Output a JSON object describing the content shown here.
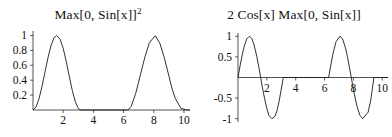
{
  "figure": {
    "background": "#ffffff",
    "stroke_color": "#1a1a1a",
    "panels": 2
  },
  "chart_data": [
    {
      "type": "line",
      "id": "left",
      "title": "Max[0, Sin[x]]",
      "title_superscript": "2",
      "title_full": "Max[0, Sin[x]]^2",
      "expression": "max(0, sin(x))^2",
      "xlabel": "",
      "ylabel": "",
      "xlim": [
        0,
        10.4
      ],
      "ylim": [
        0,
        1.06
      ],
      "grid": false,
      "legend": null,
      "xticks": [
        2,
        4,
        6,
        8,
        10
      ],
      "xticklabels": [
        "2",
        "4",
        "6",
        "8",
        "10"
      ],
      "yticks": [
        0.2,
        0.4,
        0.6,
        0.8,
        1
      ],
      "yticklabels": [
        "0.2",
        "0.4",
        "0.6",
        "0.8",
        "1"
      ],
      "x": [
        0,
        0.2,
        0.4,
        0.6,
        0.8,
        1,
        1.2,
        1.4,
        1.5708,
        1.8,
        2,
        2.2,
        2.4,
        2.6,
        2.8,
        3,
        3.1416,
        3.4,
        3.8,
        4.2,
        4.6,
        5,
        5.4,
        5.8,
        6.2,
        6.2832,
        6.5,
        6.8,
        7.1,
        7.4,
        7.7,
        7.854,
        8.1,
        8.4,
        8.7,
        9,
        9.2,
        9.4248,
        9.8,
        10.2,
        10.4
      ],
      "y": [
        0,
        0.0395,
        0.1517,
        0.3188,
        0.5148,
        0.7081,
        0.8686,
        0.9709,
        1,
        0.9477,
        0.8268,
        0.6541,
        0.4559,
        0.2648,
        0.1128,
        0.0199,
        0,
        0,
        0,
        0,
        0,
        0,
        0,
        0,
        0,
        0,
        0.0472,
        0.2196,
        0.4583,
        0.7017,
        0.8974,
        0.9393,
        0.9964,
        0.8983,
        0.7006,
        0.4573,
        0.2935,
        0.1559,
        0.0216,
        0,
        0
      ]
    },
    {
      "type": "line",
      "id": "right",
      "title": "2 Cos[x] Max[0, Sin[x]]",
      "title_superscript": "",
      "title_full": "2 Cos[x] Max[0, Sin[x]]",
      "expression": "2*cos(x)*max(0, sin(x))",
      "xlabel": "",
      "ylabel": "",
      "xlim": [
        0,
        10.4
      ],
      "ylim": [
        -1.08,
        1.08
      ],
      "grid": false,
      "legend": null,
      "xticks": [
        2,
        4,
        6,
        8,
        10
      ],
      "xticklabels": [
        "2",
        "4",
        "6",
        "8",
        "10"
      ],
      "yticks": [
        -1,
        -0.5,
        0.5,
        1
      ],
      "yticklabels": [
        "-1",
        "-0.5",
        "0.5",
        "1"
      ],
      "x": [
        0,
        0.15,
        0.3,
        0.45,
        0.6,
        0.7854,
        0.95,
        1.1,
        1.3,
        1.45,
        1.5708,
        1.7,
        1.85,
        2,
        2.15,
        2.3562,
        2.55,
        2.7,
        2.85,
        3,
        3.1416,
        3.5,
        4,
        4.5,
        5,
        5.5,
        6,
        6.2832,
        6.45,
        6.6,
        6.8,
        7.0686,
        7.25,
        7.45,
        7.6,
        7.854,
        8.05,
        8.25,
        8.45,
        8.65,
        9.0248,
        9.2,
        9.4248,
        9.8,
        10.2,
        10.4
      ],
      "y": [
        0,
        0.2955,
        0.5646,
        0.7833,
        0.932,
        1,
        0.9539,
        0.8085,
        0.5155,
        0.2392,
        0,
        -0.2579,
        -0.5188,
        -0.7568,
        -0.9249,
        -1,
        -0.9463,
        -0.8084,
        -0.5783,
        -0.2794,
        0,
        0,
        0,
        0,
        0,
        0,
        0,
        0,
        0.3271,
        0.5985,
        0.8716,
        1,
        0.9408,
        0.7185,
        0.4855,
        0,
        -0.3796,
        -0.7007,
        -0.9172,
        -0.9985,
        -0.8415,
        -0.5577,
        0,
        0,
        0,
        0
      ]
    }
  ]
}
